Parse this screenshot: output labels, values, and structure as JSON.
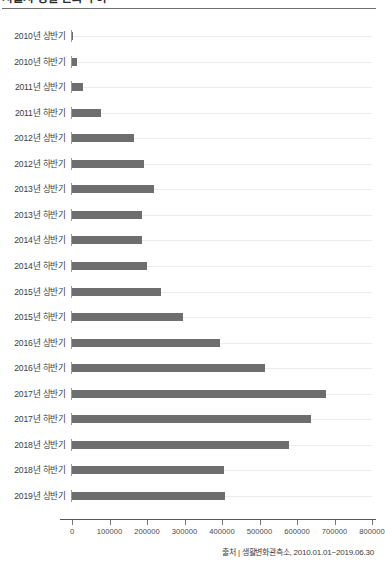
{
  "header": {
    "title": "서울시 생활 변화 추이",
    "divider": true
  },
  "source_note": "출처 | 생활변화관측소, 2010.01.01~2019.06.30",
  "axis": {
    "tick_labels": [
      "0",
      "100000",
      "200000",
      "300000",
      "400000",
      "500000",
      "600000",
      "700000",
      "800000"
    ]
  },
  "colors": {
    "bar": "#6e6e6e",
    "gridline": "#ececec",
    "axis": "#555555",
    "text": "#3d3d3d"
  },
  "chart_data": {
    "type": "bar",
    "orientation": "horizontal",
    "title": "서울시 생활 변화 추이",
    "xlabel": "",
    "ylabel": "",
    "xlim": [
      0,
      800000
    ],
    "grid": true,
    "legend": false,
    "categories": [
      "2010년 상반기",
      "2010년 하반기",
      "2011년 상반기",
      "2011년 하반기",
      "2012년 상반기",
      "2012년 하반기",
      "2013년 상반기",
      "2013년 하반기",
      "2014년 상반기",
      "2014년 하반기",
      "2015년 상반기",
      "2015년 하반기",
      "2016년 상반기",
      "2016년 하반기",
      "2017년 상반기",
      "2017년 하반기",
      "2018년 상반기",
      "2018년 하반기",
      "2019년 상반기"
    ],
    "values": [
      3000,
      12000,
      28000,
      76000,
      164000,
      193000,
      219000,
      187000,
      186000,
      199000,
      236000,
      297000,
      395000,
      515000,
      677000,
      637000,
      579000,
      406000,
      407000
    ],
    "xticks": [
      0,
      100000,
      200000,
      300000,
      400000,
      500000,
      600000,
      700000,
      800000
    ]
  }
}
